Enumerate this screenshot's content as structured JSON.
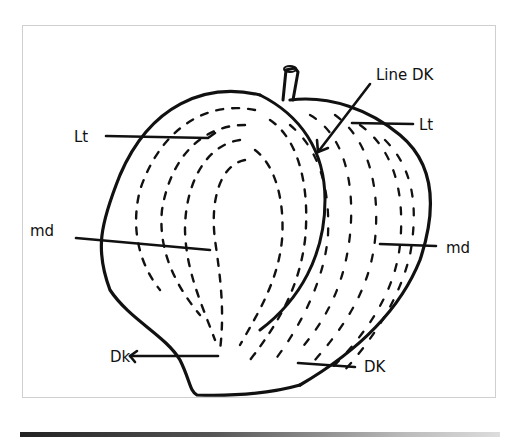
{
  "diagram": {
    "labels": {
      "line_dk": "Line DK",
      "lt_left": "Lt",
      "lt_right": "Lt",
      "md_left": "md",
      "md_right": "md",
      "dk_left": "Dk",
      "dk_right": "DK"
    },
    "colors": {
      "ink": "#111111",
      "paper": "#ffffff",
      "frame": "#cfcfcf"
    }
  }
}
